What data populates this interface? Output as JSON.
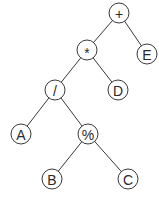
{
  "diagram": {
    "type": "expression-tree",
    "nodes": [
      {
        "id": "plus",
        "label": "+",
        "x": 119,
        "y": 13
      },
      {
        "id": "star",
        "label": "*",
        "x": 87,
        "y": 50
      },
      {
        "id": "E",
        "label": "E",
        "x": 147,
        "y": 54
      },
      {
        "id": "slash",
        "label": "/",
        "x": 55,
        "y": 90
      },
      {
        "id": "D",
        "label": "D",
        "x": 118,
        "y": 90
      },
      {
        "id": "A",
        "label": "A",
        "x": 21,
        "y": 134
      },
      {
        "id": "percent",
        "label": "%",
        "x": 88,
        "y": 134
      },
      {
        "id": "B",
        "label": "B",
        "x": 52,
        "y": 179
      },
      {
        "id": "C",
        "label": "C",
        "x": 128,
        "y": 179
      }
    ],
    "edges": [
      [
        "plus",
        "star"
      ],
      [
        "plus",
        "E"
      ],
      [
        "star",
        "slash"
      ],
      [
        "star",
        "D"
      ],
      [
        "slash",
        "A"
      ],
      [
        "slash",
        "percent"
      ],
      [
        "percent",
        "B"
      ],
      [
        "percent",
        "C"
      ]
    ],
    "style": {
      "stroke": "#3a3a3a",
      "fill": "#ffffff",
      "radius": 10
    }
  }
}
